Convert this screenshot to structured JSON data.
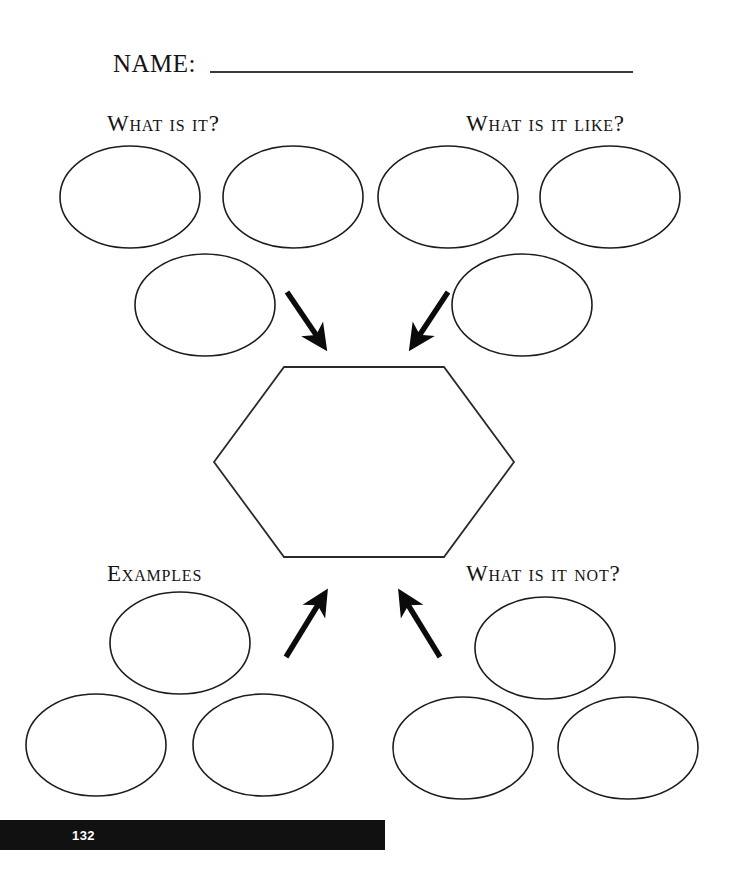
{
  "page": {
    "background_color": "#ffffff",
    "ink_color": "#141414",
    "width": 731,
    "height": 894
  },
  "name_field": {
    "label": "NAME:",
    "value": "",
    "placeholder": "",
    "rule_color": "#3a3a3a",
    "label_x": 113,
    "label_baseline_y": 72,
    "rule_x1": 210,
    "rule_x2": 633,
    "rule_y": 72
  },
  "headings": {
    "what_is_it": "What is it?",
    "what_is_it_like": "What is it like?",
    "examples": "Examples",
    "what_is_it_not": "What is it not?"
  },
  "heading_positions": [
    {
      "key": "what_is_it",
      "x": 107,
      "y": 131
    },
    {
      "key": "what_is_it_like",
      "x": 466,
      "y": 131
    },
    {
      "key": "examples",
      "x": 107,
      "y": 581
    },
    {
      "key": "what_is_it_not",
      "x": 466,
      "y": 581
    }
  ],
  "center_shape": {
    "type": "hexagon",
    "label": "",
    "points": "284,367 444,367 514,462 444,557 284,557 214,462",
    "stroke_color": "#2a2a2a",
    "fill_color": "#ffffff"
  },
  "bubble_style": {
    "rx": 70,
    "ry": 51,
    "stroke_color": "#1d1d1d",
    "fill_color": "#ffffff"
  },
  "bubbles": [
    {
      "group": "what_is_it",
      "index": 0,
      "cx": 130,
      "cy": 197,
      "value": ""
    },
    {
      "group": "what_is_it",
      "index": 1,
      "cx": 293,
      "cy": 197,
      "value": ""
    },
    {
      "group": "what_is_it",
      "index": 2,
      "cx": 205,
      "cy": 305,
      "value": ""
    },
    {
      "group": "what_is_it_like",
      "index": 0,
      "cx": 448,
      "cy": 197,
      "value": ""
    },
    {
      "group": "what_is_it_like",
      "index": 1,
      "cx": 610,
      "cy": 197,
      "value": ""
    },
    {
      "group": "what_is_it_like",
      "index": 2,
      "cx": 522,
      "cy": 305,
      "value": ""
    },
    {
      "group": "examples",
      "index": 0,
      "cx": 180,
      "cy": 643,
      "value": ""
    },
    {
      "group": "examples",
      "index": 1,
      "cx": 96,
      "cy": 745,
      "value": ""
    },
    {
      "group": "examples",
      "index": 2,
      "cx": 263,
      "cy": 745,
      "value": ""
    },
    {
      "group": "what_is_it_not",
      "index": 0,
      "cx": 545,
      "cy": 648,
      "value": ""
    },
    {
      "group": "what_is_it_not",
      "index": 1,
      "cx": 463,
      "cy": 748,
      "value": ""
    },
    {
      "group": "what_is_it_not",
      "index": 2,
      "cx": 628,
      "cy": 748,
      "value": ""
    }
  ],
  "arrows": [
    {
      "name": "arrow-top-left",
      "direction": "down-right",
      "x1": 287,
      "y1": 292,
      "x2": 328,
      "y2": 352,
      "color": "#0b0b0b"
    },
    {
      "name": "arrow-top-right",
      "direction": "down-left",
      "x1": 448,
      "y1": 292,
      "x2": 409,
      "y2": 352,
      "color": "#0b0b0b"
    },
    {
      "name": "arrow-bottom-left",
      "direction": "up-right",
      "x1": 286,
      "y1": 657,
      "x2": 328,
      "y2": 588,
      "color": "#0b0b0b"
    },
    {
      "name": "arrow-bottom-right",
      "direction": "up-left",
      "x1": 440,
      "y1": 657,
      "x2": 398,
      "y2": 588,
      "color": "#0b0b0b"
    }
  ],
  "footer": {
    "page_number": "132",
    "bar_color": "#111111",
    "text_color": "#ffffff",
    "bar_x": 0,
    "bar_y": 820,
    "bar_width": 385,
    "bar_height": 30,
    "num_x": 72,
    "num_baseline_y": 840
  }
}
